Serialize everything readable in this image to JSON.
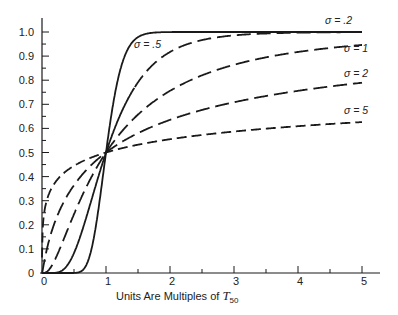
{
  "chart_data": {
    "type": "line",
    "title": "",
    "xlabel": "Units Are Multiples of T50",
    "xlabel_main": "Units Are Multiples of ",
    "xlabel_symbol": "T",
    "xlabel_subscript": "50",
    "ylabel": "",
    "xlim": [
      0,
      5
    ],
    "ylim": [
      0,
      1.0
    ],
    "x_ticks": [
      0,
      1,
      2,
      3,
      4,
      5
    ],
    "x_minor_ticks": [
      0.5,
      1.5,
      2.5,
      3.5,
      4.5
    ],
    "y_ticks": [
      0,
      0.1,
      0.2,
      0.3,
      0.4,
      0.5,
      0.6,
      0.7,
      0.8,
      0.9,
      1.0
    ],
    "y_tick_labels": [
      "0",
      "0.1",
      "0.2",
      "0.3",
      "0.4",
      "0.5",
      "0.6",
      "0.7",
      "0.8",
      "0.9",
      "1.0"
    ],
    "y_minor_ticks": [
      0.05,
      0.15,
      0.25,
      0.35,
      0.45,
      0.55,
      0.65,
      0.75,
      0.85,
      0.95
    ],
    "grid": false,
    "legend": "inline labels at curve ends",
    "function": "lognormal CDF F(t) = Phi(ln(t) / sigma), t in multiples of T50",
    "series": [
      {
        "name": "σ = .2",
        "sigma": 0.2,
        "style": "solid",
        "x": [
          0.5,
          0.7,
          0.8,
          0.9,
          1.0,
          1.1,
          1.2,
          1.4,
          1.6,
          2,
          3,
          4,
          5
        ],
        "values": [
          0.0,
          0.04,
          0.13,
          0.3,
          0.5,
          0.68,
          0.82,
          0.95,
          0.99,
          1.0,
          1.0,
          1.0,
          1.0
        ],
        "label_pos": [
          325,
          24
        ]
      },
      {
        "name": "σ = .5",
        "sigma": 0.5,
        "style": "solid-then-dashed",
        "x": [
          0.2,
          0.4,
          0.6,
          0.8,
          1.0,
          1.5,
          2,
          3,
          4,
          5
        ],
        "values": [
          0.0,
          0.03,
          0.15,
          0.33,
          0.5,
          0.79,
          0.92,
          0.99,
          1.0,
          1.0
        ],
        "label_pos": [
          134,
          48
        ]
      },
      {
        "name": "σ = 1",
        "sigma": 1,
        "style": "long-dash",
        "x": [
          0.1,
          0.25,
          0.5,
          0.75,
          1.0,
          1.5,
          2,
          3,
          4,
          5
        ],
        "values": [
          0.01,
          0.08,
          0.24,
          0.39,
          0.5,
          0.66,
          0.76,
          0.86,
          0.92,
          0.95
        ],
        "label_pos": [
          344,
          52
        ]
      },
      {
        "name": "σ = 2",
        "sigma": 2,
        "style": "long-dash",
        "x": [
          0.01,
          0.1,
          0.25,
          0.5,
          1.0,
          2,
          3,
          4,
          5
        ],
        "values": [
          0.01,
          0.12,
          0.24,
          0.36,
          0.5,
          0.64,
          0.71,
          0.76,
          0.79
        ],
        "label_pos": [
          344,
          77
        ]
      },
      {
        "name": "σ = 5",
        "sigma": 5,
        "style": "dashed",
        "x": [
          0.01,
          0.1,
          0.25,
          0.5,
          1.0,
          2,
          3,
          4,
          5
        ],
        "values": [
          0.18,
          0.32,
          0.39,
          0.45,
          0.5,
          0.56,
          0.59,
          0.61,
          0.63
        ],
        "label_pos": [
          344,
          114
        ]
      }
    ]
  },
  "axes": {
    "x_labels": [
      "0",
      "1",
      "2",
      "3",
      "4",
      "5"
    ]
  }
}
